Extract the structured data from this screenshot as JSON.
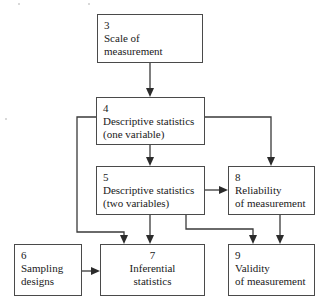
{
  "diagram": {
    "background_color": "#ffffff",
    "box_border_color": "#4a4a4a",
    "edge_color": "#3a3a3a",
    "text_color": "#1a1a1a"
  },
  "nodes": {
    "n3": {
      "number": "3",
      "line1": "Scale of",
      "line2": "measurement",
      "align": "left"
    },
    "n4": {
      "number": "4",
      "line1": "Descriptive statistics",
      "line2": "(one variable)",
      "align": "left"
    },
    "n5": {
      "number": "5",
      "line1": "Descriptive statistics",
      "line2": "(two variables)",
      "align": "left"
    },
    "n6": {
      "number": "6",
      "line1": "Sampling",
      "line2": "designs",
      "align": "left"
    },
    "n7": {
      "number": "7",
      "line1": "Inferential",
      "line2": "statistics",
      "align": "center"
    },
    "n8": {
      "number": "8",
      "line1": "Reliability",
      "line2": "of measurement",
      "align": "left"
    },
    "n9": {
      "number": "9",
      "line1": "Validity",
      "line2": "of measurement",
      "align": "left"
    }
  },
  "edges": [
    {
      "id": "e3-4",
      "from": "n3",
      "to": "n4",
      "routing": "vertical"
    },
    {
      "id": "e4-5",
      "from": "n4",
      "to": "n5",
      "routing": "vertical"
    },
    {
      "id": "e4-7",
      "from": "n4",
      "to": "n7",
      "routing": "left-bypass"
    },
    {
      "id": "e4-8",
      "from": "n4",
      "to": "n8",
      "routing": "right-elbow"
    },
    {
      "id": "e5-7",
      "from": "n5",
      "to": "n7",
      "routing": "vertical"
    },
    {
      "id": "e5-8",
      "from": "n5",
      "to": "n8",
      "routing": "horizontal"
    },
    {
      "id": "e5-9",
      "from": "n5",
      "to": "n9",
      "routing": "right-elbow"
    },
    {
      "id": "e8-9",
      "from": "n8",
      "to": "n9",
      "routing": "vertical"
    },
    {
      "id": "e6-7",
      "from": "n6",
      "to": "n7",
      "routing": "horizontal"
    }
  ]
}
